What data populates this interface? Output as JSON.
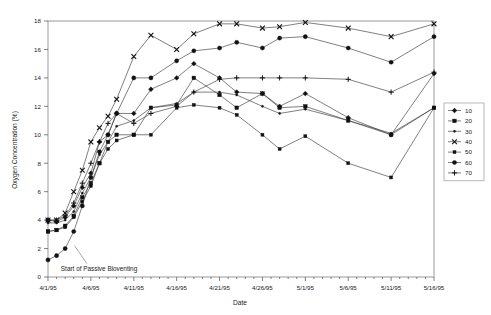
{
  "chart_data": {
    "type": "line",
    "title": "",
    "xlabel": "Date",
    "ylabel": "Oxygen Concentration (%)",
    "ylim": [
      0,
      18
    ],
    "ytick_step": 2,
    "yticks": [
      "0",
      "2",
      "4",
      "6",
      "8",
      "10",
      "12",
      "14",
      "16",
      "18"
    ],
    "xticks": [
      "4/1/95",
      "4/6/95",
      "4/11/95",
      "4/16/95",
      "4/21/95",
      "4/26/95",
      "5/1/95",
      "5/6/95",
      "5/11/95",
      "5/16/95"
    ],
    "xlim_days": [
      0,
      45
    ],
    "xtick_days": [
      0,
      5,
      10,
      15,
      20,
      25,
      30,
      35,
      40,
      45
    ],
    "minor_tick_step_days": 1,
    "grid": false,
    "legend_position": "right-outside",
    "annotations": [
      {
        "text": "Start of Passive Bioventing",
        "x_day": 1.5,
        "y": 0.45,
        "pointer_to_x_day": 3.1,
        "pointer_to_y": 2.2
      }
    ],
    "series": [
      {
        "name": "10",
        "marker": "diamond",
        "x": [
          0,
          1,
          2,
          3,
          4,
          5,
          6,
          7,
          8,
          10,
          12,
          15,
          17,
          20,
          22,
          25,
          27,
          30,
          35,
          40,
          45
        ],
        "values": [
          4.0,
          3.9,
          4.2,
          5.0,
          6.3,
          7.3,
          9.5,
          10.0,
          11.5,
          11.5,
          13.2,
          14.0,
          15.0,
          14.0,
          13.0,
          12.9,
          12.0,
          12.9,
          11.2,
          10.0,
          14.3
        ]
      },
      {
        "name": "20",
        "marker": "square",
        "x": [
          0,
          1,
          2,
          3,
          4,
          5,
          6,
          7,
          8,
          10,
          12,
          15,
          17,
          20,
          22,
          25,
          27,
          30,
          35,
          40,
          45
        ],
        "values": [
          3.2,
          3.3,
          3.6,
          4.3,
          5.6,
          6.6,
          8.0,
          9.5,
          10.0,
          10.0,
          11.9,
          12.1,
          14.0,
          12.8,
          11.9,
          12.9,
          11.9,
          12.0,
          11.0,
          10.0,
          11.9
        ]
      },
      {
        "name": "30",
        "marker": "dot",
        "x": [
          0,
          1,
          2,
          3,
          4,
          5,
          6,
          7,
          8,
          10,
          12,
          15,
          17,
          20,
          22,
          25,
          27,
          30,
          35,
          40,
          45
        ],
        "values": [
          3.8,
          3.8,
          4.0,
          4.6,
          5.9,
          7.0,
          8.6,
          9.5,
          10.6,
          11.0,
          11.9,
          12.2,
          13.0,
          13.0,
          12.8,
          12.0,
          11.5,
          11.8,
          11.0,
          10.1,
          11.9
        ]
      },
      {
        "name": "40",
        "marker": "cross-x",
        "x": [
          0,
          1,
          2,
          3,
          4,
          5,
          6,
          7,
          8,
          10,
          12,
          15,
          17,
          20,
          22,
          25,
          27,
          30,
          35,
          40,
          45
        ],
        "values": [
          4.0,
          4.0,
          4.5,
          6.0,
          7.5,
          9.5,
          10.5,
          11.3,
          12.5,
          15.5,
          17.0,
          16.0,
          17.1,
          17.8,
          17.8,
          17.5,
          17.6,
          17.9,
          17.5,
          16.9,
          17.8
        ]
      },
      {
        "name": "50",
        "marker": "square-small",
        "x": [
          0,
          1,
          2,
          3,
          4,
          5,
          6,
          7,
          8,
          10,
          12,
          15,
          17,
          20,
          22,
          25,
          27,
          30,
          35,
          40,
          45
        ],
        "values": [
          3.2,
          3.3,
          3.5,
          4.2,
          5.3,
          6.4,
          8.0,
          9.0,
          9.6,
          10.0,
          10.0,
          11.9,
          12.1,
          11.9,
          11.4,
          10.0,
          9.0,
          9.9,
          8.0,
          7.0,
          11.9
        ]
      },
      {
        "name": "60",
        "marker": "circle",
        "x": [
          0,
          1,
          2,
          3,
          4,
          5,
          6,
          7,
          8,
          10,
          12,
          15,
          17,
          20,
          22,
          25,
          27,
          30,
          35,
          40,
          45
        ],
        "values": [
          1.2,
          1.5,
          2.0,
          3.2,
          5.0,
          7.0,
          8.8,
          10.0,
          11.5,
          14.0,
          14.0,
          15.2,
          15.9,
          16.1,
          16.5,
          16.1,
          16.8,
          16.9,
          16.1,
          15.1,
          16.9
        ]
      },
      {
        "name": "70",
        "marker": "plus",
        "x": [
          0,
          1,
          2,
          3,
          4,
          5,
          6,
          7,
          8,
          10,
          12,
          15,
          17,
          20,
          22,
          25,
          27,
          30,
          35,
          40,
          45
        ],
        "values": [
          4.0,
          4.0,
          4.3,
          5.2,
          6.6,
          8.0,
          9.5,
          10.8,
          11.5,
          10.8,
          11.5,
          12.0,
          13.0,
          13.9,
          14.0,
          14.0,
          14.0,
          14.0,
          13.9,
          13.0,
          14.4
        ]
      }
    ]
  },
  "legend": {
    "items": [
      {
        "label": "10",
        "marker": "diamond"
      },
      {
        "label": "20",
        "marker": "square"
      },
      {
        "label": "30",
        "marker": "dot"
      },
      {
        "label": "40",
        "marker": "cross-x"
      },
      {
        "label": "50",
        "marker": "square-small"
      },
      {
        "label": "60",
        "marker": "circle"
      },
      {
        "label": "70",
        "marker": "plus"
      }
    ]
  }
}
